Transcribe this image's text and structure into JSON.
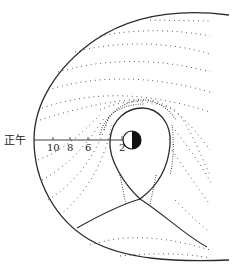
{
  "figure": {
    "title_label": "正午",
    "axis_ticks": [
      "10",
      "8",
      "6",
      "2"
    ],
    "colors": {
      "line": "#2a2a2a",
      "dots": "#333333",
      "earth_dark": "#111111",
      "background": "#ffffff"
    },
    "elements": [
      "magnetopause-boundary",
      "plasmapause-teardrop",
      "earth-day-night",
      "convection-streamlines"
    ]
  }
}
